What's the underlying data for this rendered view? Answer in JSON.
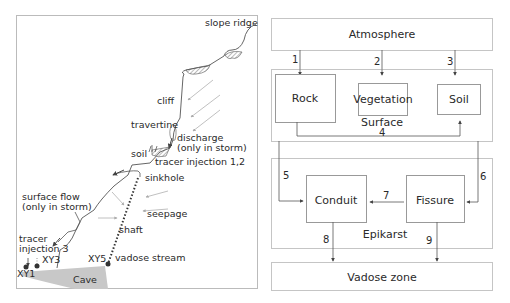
{
  "left_panel": {
    "labels": {
      "slope_ridge": "slope ridge",
      "cliff": "cliff",
      "travertine": "travertine",
      "discharge_1": "discharge",
      "discharge_2": "(only in storm)",
      "soil": "soil",
      "tracer_injection_12": "tracer injection 1,2",
      "sinkhole": "sinkhole",
      "surface_flow_1": "surface flow",
      "surface_flow_2": "(only in storm)",
      "seepage": "seepage",
      "shaft": "shaft",
      "tracer_injection_3_a": "tracer",
      "tracer_injection_3_b": "injection 3",
      "xy1": "XY1",
      "xy3": "XY3",
      "xy5": "XY5",
      "vadose_stream": "vadose stream",
      "cave": "Cave"
    }
  },
  "right_panel": {
    "atmosphere": "Atmosphere",
    "surface": {
      "label": "Surface",
      "rock": "Rock",
      "vegetation": "Vegetation",
      "soil": "Soil"
    },
    "epikarst": {
      "label": "Epikarst",
      "conduit": "Conduit",
      "fissure": "Fissure"
    },
    "vadose_zone": "Vadose zone",
    "flow_numbers": [
      "1",
      "2",
      "3",
      "4",
      "5",
      "6",
      "7",
      "8",
      "9"
    ]
  },
  "colors": {
    "line": "#555555",
    "box_border": "#8a8a8a",
    "cave_fill": "#c8c8c8",
    "arrow_light": "#b0b0b0"
  }
}
